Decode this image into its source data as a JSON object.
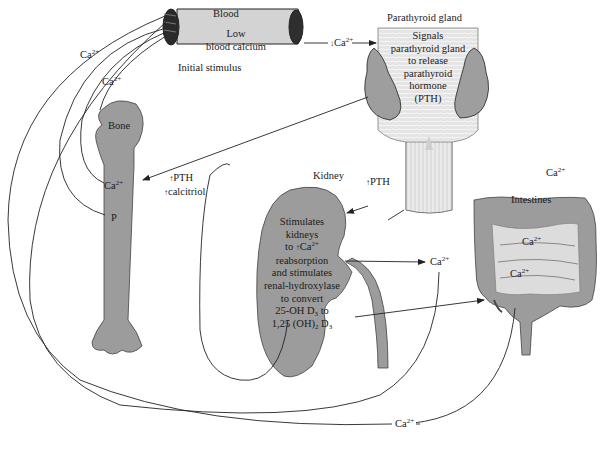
{
  "organs": {
    "blood": {
      "title": "Blood",
      "box_line1": "Low",
      "box_line2": "blood calcium",
      "caption": "Initial stimulus"
    },
    "parathyroid": {
      "title": "Parathyroid gland",
      "lines": [
        "Signals",
        "parathyroid gland",
        "to release",
        "parathyroid",
        "hormone",
        "(PTH)"
      ]
    },
    "bone": {
      "title": "Bone",
      "ca_label": "Ca",
      "p_label": "P"
    },
    "kidney": {
      "title": "Kidney",
      "lines": [
        "Stimulates",
        "kidneys",
        "to",
        "Ca",
        "reabsorption",
        "and stimulates",
        "renal-hydroxylase",
        "to convert",
        "25-OH D",
        "to",
        "1,25 (OH)",
        "D"
      ]
    },
    "intestines": {
      "title": "Intestines",
      "ca_upper": "Ca",
      "ca_lower": "Ca"
    }
  },
  "flows": {
    "blood_to_parathyroid": {
      "arrow": "↓",
      "ion": "Ca",
      "charge": "2+"
    },
    "to_bone_pth": {
      "arrow": "↑",
      "text": "PTH"
    },
    "to_bone_calcitriol": {
      "arrow": "↑",
      "text": "calcitriol"
    },
    "to_kidney_pth": {
      "arrow": "↑",
      "text": "PTH"
    },
    "kidney_ca_out": {
      "ion": "Ca",
      "charge": "2+"
    },
    "intestine_top_ca": {
      "ion": "Ca",
      "charge": "2+"
    },
    "blood_ca_left_outer": {
      "ion": "Ca",
      "charge": "2+"
    },
    "blood_ca_left_inner": {
      "ion": "Ca",
      "charge": "2+"
    },
    "bottom_return_ca": {
      "ion": "Ca",
      "charge": "2+"
    }
  },
  "common": {
    "charge": "2+",
    "sub3": "3",
    "sub2": "2",
    "up_arrow": "↑",
    "down_arrow": "↓"
  },
  "colors": {
    "organ_fill": "#9a9a9a",
    "organ_light": "#dcdcdc",
    "vessel_fill": "#d0d0d0",
    "vessel_end": "#2a2a2a",
    "line": "#222222"
  }
}
